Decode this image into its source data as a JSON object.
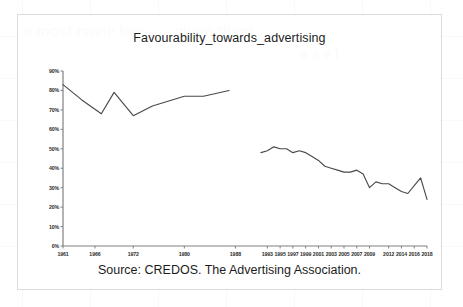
{
  "chart_data": {
    "type": "line",
    "title": "Favourability_towards_advertising",
    "source": "Source: CREDOS. The Advertising Association.",
    "xlabel": "",
    "ylabel": "",
    "ylim": [
      0,
      90
    ],
    "ytick_labels": [
      "0%",
      "10%",
      "20%",
      "30%",
      "40%",
      "50%",
      "60%",
      "70%",
      "80%",
      "90%"
    ],
    "ytick_values": [
      0,
      10,
      20,
      30,
      40,
      50,
      60,
      70,
      80,
      90
    ],
    "xtick_labels": [
      "1961",
      "1966",
      "1972",
      "1980",
      "1988",
      "1993",
      "1995",
      "1997",
      "1999",
      "2001",
      "2003",
      "2005",
      "2007",
      "2009",
      "2012",
      "2014",
      "2016",
      "2018"
    ],
    "xlim": [
      1961,
      2018
    ],
    "grid": false,
    "legend": "none",
    "line_color": "#4a4a4a",
    "axis_color": "#808080",
    "series": [
      {
        "name": "Favourability 1961-1987",
        "x": [
          1961,
          1964,
          1967,
          1969,
          1972,
          1975,
          1980,
          1983,
          1987
        ],
        "values": [
          83,
          75,
          68,
          79,
          67,
          72,
          77,
          77,
          80
        ]
      },
      {
        "name": "Favourability 1992-2018",
        "x": [
          1992,
          1993,
          1994,
          1995,
          1996,
          1997,
          1998,
          1999,
          2000,
          2001,
          2002,
          2003,
          2004,
          2005,
          2006,
          2007,
          2008,
          2009,
          2010,
          2011,
          2012,
          2013,
          2014,
          2015,
          2016,
          2017,
          2018
        ],
        "values": [
          48,
          49,
          51,
          50,
          50,
          48,
          49,
          48,
          46,
          44,
          41,
          40,
          39,
          38,
          38,
          39,
          37,
          30,
          33,
          32,
          32,
          30,
          28,
          27,
          31,
          35,
          24
        ]
      }
    ]
  },
  "background_bleed": {
    "line1": "e  most navie  bee . . .  given  them",
    "line2": "a  s  e  l"
  }
}
